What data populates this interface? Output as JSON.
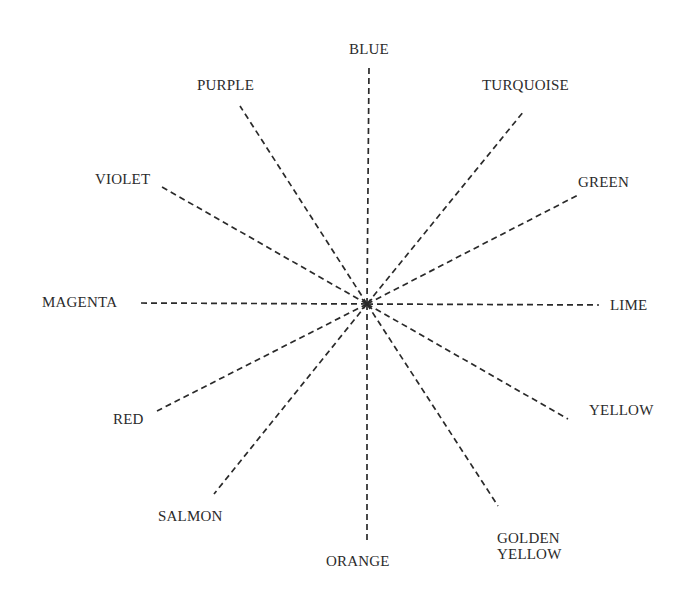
{
  "diagram": {
    "type": "radial-spokes",
    "center": {
      "x": 367,
      "y": 304
    },
    "line_style": "dashed",
    "line_color": "#2a2a2a",
    "text_color": "#2b2b2b",
    "spokes": [
      {
        "id": "blue",
        "label": "BLUE",
        "end": {
          "x": 369,
          "y": 68
        },
        "label_pos": {
          "x": 349,
          "y": 41
        }
      },
      {
        "id": "turquoise",
        "label": "TURQUOISE",
        "end": {
          "x": 524,
          "y": 111
        },
        "label_pos": {
          "x": 482,
          "y": 77
        }
      },
      {
        "id": "green",
        "label": "GREEN",
        "end": {
          "x": 580,
          "y": 194
        },
        "label_pos": {
          "x": 578,
          "y": 174
        }
      },
      {
        "id": "lime",
        "label": "LIME",
        "end": {
          "x": 599,
          "y": 305
        },
        "label_pos": {
          "x": 610,
          "y": 297
        }
      },
      {
        "id": "yellow",
        "label": "YELLOW",
        "end": {
          "x": 568,
          "y": 419
        },
        "label_pos": {
          "x": 589,
          "y": 402
        }
      },
      {
        "id": "golden-yellow",
        "label_lines": [
          "GOLDEN",
          "YELLOW"
        ],
        "end": {
          "x": 498,
          "y": 506
        },
        "label_pos": {
          "x": 497,
          "y": 530
        }
      },
      {
        "id": "orange",
        "label": "ORANGE",
        "end": {
          "x": 367,
          "y": 542
        },
        "label_pos": {
          "x": 326,
          "y": 553
        }
      },
      {
        "id": "salmon",
        "label": "SALMON",
        "end": {
          "x": 214,
          "y": 494
        },
        "label_pos": {
          "x": 158,
          "y": 508
        }
      },
      {
        "id": "red",
        "label": "RED",
        "end": {
          "x": 157,
          "y": 411
        },
        "label_pos": {
          "x": 113,
          "y": 411
        }
      },
      {
        "id": "magenta",
        "label": "MAGENTA",
        "end": {
          "x": 139,
          "y": 303
        },
        "label_pos": {
          "x": 42,
          "y": 294
        }
      },
      {
        "id": "violet",
        "label": "VIOLET",
        "end": {
          "x": 162,
          "y": 187
        },
        "label_pos": {
          "x": 95,
          "y": 171
        }
      },
      {
        "id": "purple",
        "label": "PURPLE",
        "end": {
          "x": 240,
          "y": 106
        },
        "label_pos": {
          "x": 197,
          "y": 77
        }
      }
    ]
  }
}
